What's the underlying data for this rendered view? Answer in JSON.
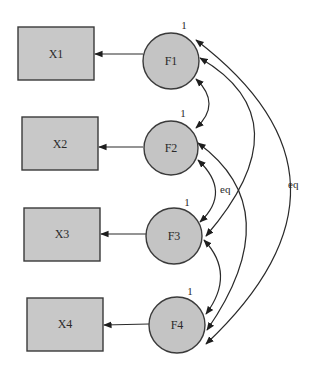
{
  "diagram": {
    "type": "structural-equation-model",
    "observed": [
      {
        "id": "X1",
        "label": "X1"
      },
      {
        "id": "X2",
        "label": "X2"
      },
      {
        "id": "X3",
        "label": "X3"
      },
      {
        "id": "X4",
        "label": "X4"
      }
    ],
    "latent": [
      {
        "id": "F1",
        "label": "F1",
        "variance": "1"
      },
      {
        "id": "F2",
        "label": "F2",
        "variance": "1"
      },
      {
        "id": "F3",
        "label": "F3",
        "variance": "1"
      },
      {
        "id": "F4",
        "label": "F4",
        "variance": "1"
      }
    ],
    "loadings": [
      {
        "from": "F1",
        "to": "X1"
      },
      {
        "from": "F2",
        "to": "X2"
      },
      {
        "from": "F3",
        "to": "X3"
      },
      {
        "from": "F4",
        "to": "X4"
      }
    ],
    "covariances": [
      {
        "a": "F1",
        "b": "F2",
        "label": ""
      },
      {
        "a": "F2",
        "b": "F3",
        "label": "eq"
      },
      {
        "a": "F3",
        "b": "F4",
        "label": ""
      },
      {
        "a": "F1",
        "b": "F3",
        "label": ""
      },
      {
        "a": "F2",
        "b": "F4",
        "label": ""
      },
      {
        "a": "F1",
        "b": "F4",
        "label": "eq"
      }
    ],
    "labels": {
      "eq_inner": "eq",
      "eq_outer": "eq"
    }
  }
}
